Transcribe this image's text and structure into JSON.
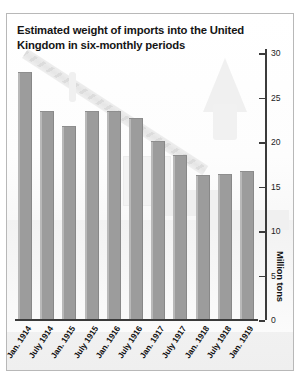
{
  "figure": {
    "title": "Estimated weight of imports into the United Kingdom in six-monthly periods"
  },
  "chart_data": {
    "type": "bar",
    "title": "Estimated weight of imports into the United Kingdom in six-monthly periods",
    "xlabel": "",
    "ylabel": "Million tons",
    "categories": [
      "Jan. 1914",
      "July 1914",
      "Jan. 1915",
      "July 1915",
      "Jan. 1916",
      "July 1916",
      "Jan. 1917",
      "July 1917",
      "Jan. 1918",
      "July 1918",
      "Jan. 1919"
    ],
    "values": [
      28,
      23.5,
      21.8,
      23.5,
      23.6,
      22.7,
      20.2,
      18.6,
      16.3,
      16.4,
      16.8
    ],
    "ylim": [
      0,
      30
    ],
    "yticks": [
      0,
      5,
      10,
      15,
      20,
      25,
      30
    ],
    "ytick_labels": [
      "0",
      "5",
      "10",
      "15",
      "20",
      "25",
      "30"
    ],
    "grid": false,
    "legend": null,
    "bar_color": "#9c9c9c",
    "axis_color": "#3b3b3b",
    "background_color": "#fbfbfb"
  }
}
